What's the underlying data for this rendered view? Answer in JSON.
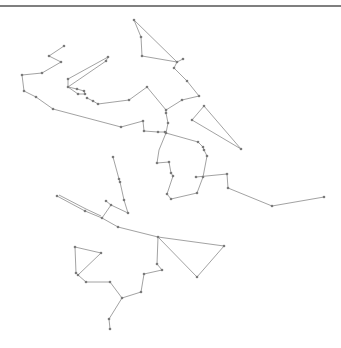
{
  "diagram": {
    "width": 341,
    "height": 348,
    "top_rule": {
      "x1": 0,
      "y1": 6,
      "x2": 341,
      "y2": 6,
      "color": "#555555"
    },
    "edge_color": "#8a8a8a",
    "node_color": "#7a7a7a",
    "node_radius": 1.3,
    "paths": [
      [
        [
          64,
          46
        ],
        [
          49,
          56
        ],
        [
          61,
          62
        ],
        [
          42,
          73
        ],
        [
          22,
          75
        ],
        [
          24,
          91
        ],
        [
          36,
          97
        ],
        [
          53,
          109
        ],
        [
          121,
          127
        ],
        [
          143,
          121
        ],
        [
          144,
          131
        ],
        [
          158,
          132
        ],
        [
          165,
          132
        ]
      ],
      [
        [
          68,
          79
        ],
        [
          108,
          57
        ],
        [
          106,
          61
        ],
        [
          68,
          87
        ],
        [
          68,
          79
        ]
      ],
      [
        [
          68,
          87
        ],
        [
          77,
          89
        ],
        [
          84,
          91
        ],
        [
          85,
          94
        ],
        [
          78,
          94
        ],
        [
          68,
          87
        ]
      ],
      [
        [
          87,
          98
        ],
        [
          93,
          101
        ],
        [
          98,
          104
        ],
        [
          129,
          100
        ],
        [
          147,
          87
        ],
        [
          166,
          110
        ],
        [
          166,
          113
        ],
        [
          168,
          123
        ],
        [
          166,
          133
        ]
      ],
      [
        [
          134,
          20
        ],
        [
          141,
          37
        ],
        [
          142,
          56
        ],
        [
          177,
          62
        ],
        [
          183,
          59
        ]
      ],
      [
        [
          134,
          20
        ],
        [
          177,
          62
        ]
      ],
      [
        [
          177,
          62
        ],
        [
          174,
          68
        ],
        [
          187,
          81
        ],
        [
          199,
          96
        ],
        [
          182,
          100
        ],
        [
          166,
          110
        ]
      ],
      [
        [
          204,
          106
        ],
        [
          192,
          120
        ],
        [
          241,
          149
        ],
        [
          204,
          106
        ]
      ],
      [
        [
          166,
          133
        ],
        [
          198,
          142
        ],
        [
          203,
          147
        ],
        [
          204,
          150
        ],
        [
          207,
          156
        ],
        [
          203,
          177
        ],
        [
          197,
          193
        ],
        [
          171,
          199
        ],
        [
          167,
          194
        ],
        [
          173,
          176
        ],
        [
          171,
          173
        ],
        [
          169,
          162
        ],
        [
          157,
          163
        ],
        [
          159,
          150
        ],
        [
          166,
          133
        ]
      ],
      [
        [
          196,
          177
        ],
        [
          227,
          174
        ],
        [
          228,
          188
        ],
        [
          272,
          206
        ],
        [
          324,
          197
        ]
      ],
      [
        [
          113,
          157
        ],
        [
          119,
          179
        ],
        [
          120,
          182
        ],
        [
          124,
          200
        ],
        [
          128,
          213
        ],
        [
          111,
          205
        ],
        [
          106,
          201
        ]
      ],
      [
        [
          57,
          196
        ],
        [
          85,
          211
        ],
        [
          102,
          218
        ]
      ],
      [
        [
          59,
          195
        ],
        [
          86,
          209
        ],
        [
          101,
          216
        ]
      ],
      [
        [
          102,
          218
        ],
        [
          111,
          205
        ]
      ],
      [
        [
          102,
          218
        ],
        [
          118,
          227
        ],
        [
          158,
          237
        ],
        [
          224,
          246
        ],
        [
          197,
          277
        ],
        [
          158,
          237
        ],
        [
          157,
          264
        ],
        [
          162,
          270
        ],
        [
          144,
          274
        ],
        [
          141,
          292
        ],
        [
          122,
          298
        ],
        [
          110,
          282
        ],
        [
          86,
          282
        ],
        [
          78,
          275
        ],
        [
          76,
          273
        ],
        [
          75,
          247
        ],
        [
          101,
          253
        ],
        [
          78,
          275
        ]
      ],
      [
        [
          122,
          298
        ],
        [
          109,
          319
        ],
        [
          110,
          329
        ]
      ]
    ],
    "nodes": [
      [
        64,
        46
      ],
      [
        49,
        56
      ],
      [
        61,
        62
      ],
      [
        42,
        73
      ],
      [
        22,
        75
      ],
      [
        24,
        91
      ],
      [
        36,
        97
      ],
      [
        53,
        109
      ],
      [
        121,
        127
      ],
      [
        143,
        121
      ],
      [
        144,
        131
      ],
      [
        158,
        132
      ],
      [
        165,
        132
      ],
      [
        68,
        79
      ],
      [
        108,
        57
      ],
      [
        106,
        61
      ],
      [
        68,
        87
      ],
      [
        77,
        89
      ],
      [
        84,
        91
      ],
      [
        85,
        94
      ],
      [
        78,
        94
      ],
      [
        87,
        98
      ],
      [
        93,
        101
      ],
      [
        98,
        104
      ],
      [
        129,
        100
      ],
      [
        147,
        87
      ],
      [
        166,
        110
      ],
      [
        166,
        113
      ],
      [
        168,
        123
      ],
      [
        166,
        133
      ],
      [
        134,
        20
      ],
      [
        141,
        37
      ],
      [
        142,
        56
      ],
      [
        177,
        62
      ],
      [
        183,
        59
      ],
      [
        174,
        68
      ],
      [
        187,
        81
      ],
      [
        199,
        96
      ],
      [
        182,
        100
      ],
      [
        204,
        106
      ],
      [
        192,
        120
      ],
      [
        241,
        149
      ],
      [
        198,
        142
      ],
      [
        203,
        147
      ],
      [
        204,
        150
      ],
      [
        207,
        156
      ],
      [
        203,
        177
      ],
      [
        197,
        193
      ],
      [
        171,
        199
      ],
      [
        167,
        194
      ],
      [
        173,
        176
      ],
      [
        171,
        173
      ],
      [
        169,
        162
      ],
      [
        157,
        163
      ],
      [
        196,
        177
      ],
      [
        227,
        174
      ],
      [
        228,
        188
      ],
      [
        272,
        206
      ],
      [
        324,
        197
      ],
      [
        113,
        157
      ],
      [
        119,
        179
      ],
      [
        120,
        182
      ],
      [
        124,
        200
      ],
      [
        128,
        213
      ],
      [
        111,
        205
      ],
      [
        106,
        201
      ],
      [
        57,
        196
      ],
      [
        85,
        211
      ],
      [
        102,
        218
      ],
      [
        118,
        227
      ],
      [
        158,
        237
      ],
      [
        224,
        246
      ],
      [
        197,
        277
      ],
      [
        157,
        264
      ],
      [
        162,
        270
      ],
      [
        144,
        274
      ],
      [
        141,
        292
      ],
      [
        122,
        298
      ],
      [
        110,
        282
      ],
      [
        86,
        282
      ],
      [
        78,
        275
      ],
      [
        76,
        273
      ],
      [
        75,
        247
      ],
      [
        101,
        253
      ],
      [
        109,
        319
      ],
      [
        110,
        329
      ]
    ]
  }
}
